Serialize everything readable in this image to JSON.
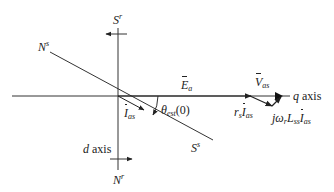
{
  "diagram": {
    "colors": {
      "line": "#333333",
      "text": "#222222",
      "background": "#ffffff"
    },
    "labels": {
      "Sr": {
        "base": "S",
        "sup": "r"
      },
      "Ns": {
        "base": "N",
        "sup": "s"
      },
      "Ss": {
        "base": "S",
        "sup": "s"
      },
      "Nr": {
        "base": "N",
        "sup": "r"
      },
      "d_axis": {
        "var": "d",
        "text": " axis"
      },
      "q_axis": {
        "var": "q",
        "text": " axis"
      },
      "Ea": {
        "base": "E",
        "sub": "a"
      },
      "Vas": {
        "base": "V",
        "sub": "as"
      },
      "Ias": {
        "base": "I",
        "sub": "as"
      },
      "theta": {
        "base": "θ",
        "sub": "est",
        "arg": "(0)"
      },
      "rsIas": {
        "coef": "r",
        "coef_sub": "s",
        "base": "I",
        "sub": "as"
      },
      "jwLIas": {
        "j": "jω",
        "w_sub": "r",
        "L": "L",
        "L_sub": "ss",
        "base": "I",
        "sub": "as"
      }
    }
  }
}
